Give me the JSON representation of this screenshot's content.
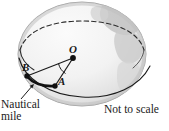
{
  "figure": {
    "type": "geometry-diagram",
    "labels": {
      "center_point": "O",
      "point_b": "B",
      "point_a": "A",
      "nautical_line1": "Nautical",
      "nautical_line2": "mile",
      "not_to_scale": "Not to scale"
    },
    "colors": {
      "line": "#1a1a1a",
      "sphere_fill": "#f4f4f4",
      "sphere_shade": "#d9d9d9",
      "continent": "#c6c6c6",
      "background": "#ffffff"
    },
    "elements": {
      "sphere": "great-sphere-globe",
      "latitude_circle": "dashed-back-solid-front-ellipse",
      "great_circle": "equator-ellipse",
      "radius_oa": "segment-O-to-A",
      "radius_ob": "segment-O-to-B",
      "angle_mark": "arc-at-O",
      "bold_arc": "arc-B-to-A-nautical-mile",
      "pointer": "arrow-from-label-to-arc"
    }
  }
}
